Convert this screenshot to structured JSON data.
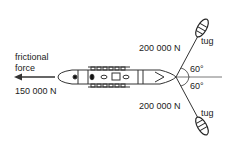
{
  "diagram": {
    "friction_label_line1": "frictional",
    "friction_label_line2": "force",
    "friction_value": "150 000 N",
    "tug_top_force": "200 000 N",
    "tug_bottom_force": "200 000 N",
    "tug_top_label": "tug",
    "tug_bottom_label": "tug",
    "angle_top": "60°",
    "angle_bottom": "60°",
    "colors": {
      "line": "#333333",
      "background": "#ffffff"
    }
  }
}
